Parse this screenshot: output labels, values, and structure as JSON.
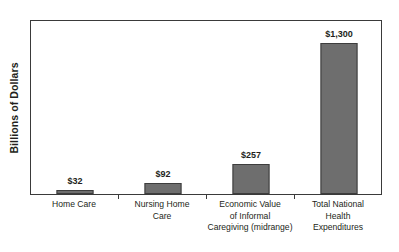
{
  "chart_data": {
    "type": "bar",
    "title": "",
    "subtitle": "",
    "xlabel": "",
    "ylabel": "Billions of Dollars",
    "ylim": [
      0,
      1300
    ],
    "grid": false,
    "legend": "none",
    "categories": [
      "Home Care",
      "Nursing Home Care",
      "Economic Value of Informal Caregiving (midrange)",
      "Total National Health Expenditures"
    ],
    "category_label_lines": [
      [
        "Home Care"
      ],
      [
        "Nursing Home",
        "Care"
      ],
      [
        "Economic Value",
        "of Informal",
        "Caregiving (midrange)"
      ],
      [
        "Total National",
        "Health",
        "Expenditures"
      ]
    ],
    "values": [
      32,
      92,
      257,
      1300
    ],
    "value_labels": [
      "$32",
      "$92",
      "$257",
      "$1,300"
    ],
    "bar_color": "#6e6e6e",
    "bar_border_color": "#3d3d3d",
    "plot_border_color": "#3a3a3a",
    "text_color": "#231f20",
    "background_color": "#ffffff"
  }
}
